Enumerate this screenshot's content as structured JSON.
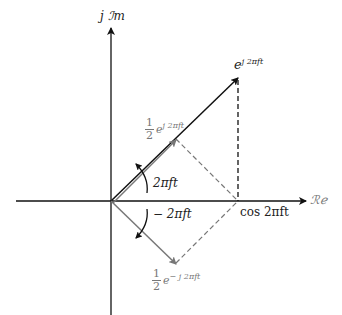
{
  "diagram": {
    "axes": {
      "real_label": "ℛℯ",
      "imag_label_prefix": "j",
      "imag_label": "ℐm"
    },
    "phasors": {
      "main": {
        "base": "e",
        "exponent": "j 2πft",
        "color": "#111111"
      },
      "upper_half": {
        "num": "1",
        "den": "2",
        "base": "e",
        "exponent": "j 2πft",
        "color": "#777777"
      },
      "lower_half": {
        "num": "1",
        "den": "2",
        "base": "e",
        "exponent": "− j 2πft",
        "color": "#777777"
      }
    },
    "angles": {
      "positive": "2πft",
      "negative": "− 2πft"
    },
    "projection_label": "cos 2πft",
    "colors": {
      "axis": "#111111",
      "main_phasor": "#111111",
      "half_phasor": "#777777",
      "dashed": "#777777"
    }
  }
}
